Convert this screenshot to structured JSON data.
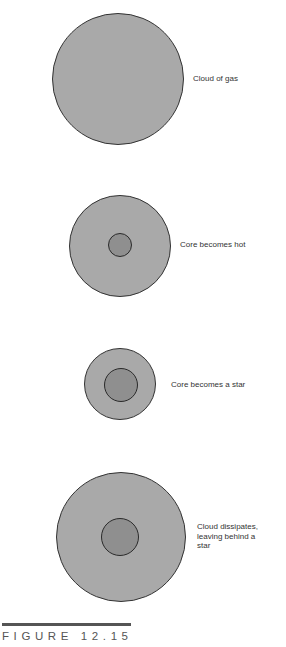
{
  "figure": {
    "caption": "FIGURE 12.15"
  },
  "colors": {
    "cloud_fill": "#a9a9a9",
    "core_fill": "#8f8f8f",
    "outline": "#333333",
    "background": "#ffffff"
  },
  "stages": [
    {
      "label": "Cloud of gas",
      "cloud": {
        "cx": 118,
        "cy": 79,
        "r": 66
      },
      "core": null
    },
    {
      "label": "Core becomes hot",
      "cloud": {
        "cx": 120,
        "cy": 246,
        "r": 51
      },
      "core": {
        "cx": 120,
        "cy": 245,
        "r": 12
      }
    },
    {
      "label": "Core becomes a star",
      "cloud": {
        "cx": 120,
        "cy": 384,
        "r": 36
      },
      "core": {
        "cx": 121,
        "cy": 385,
        "r": 17
      }
    },
    {
      "label": "Cloud dissipates,\nleaving behind a\nstar",
      "cloud": {
        "cx": 121,
        "cy": 537,
        "r": 65
      },
      "core": {
        "cx": 120,
        "cy": 537,
        "r": 19
      }
    }
  ]
}
